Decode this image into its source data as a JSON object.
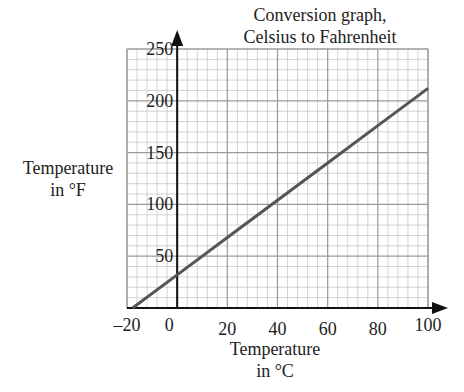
{
  "chart_data": {
    "type": "line",
    "title": "Conversion graph, Celsius to Fahrenheit",
    "title_lines": [
      "Conversion graph,",
      "Celsius to Fahrenheit"
    ],
    "xlabel": "Temperature in °C",
    "xlabel_lines": [
      "Temperature",
      "in °C"
    ],
    "ylabel": "Temperature in °F",
    "ylabel_lines": [
      "Temperature",
      "in °F"
    ],
    "xlim": [
      -20,
      100
    ],
    "ylim": [
      0,
      250
    ],
    "x_ticks": [
      -20,
      0,
      20,
      40,
      60,
      80,
      100
    ],
    "x_tick_labels": [
      "–20",
      "0",
      "20",
      "40",
      "60",
      "80",
      "100"
    ],
    "y_ticks": [
      50,
      100,
      150,
      200,
      250
    ],
    "y_tick_labels": [
      "50",
      "100",
      "150",
      "200",
      "250"
    ],
    "grid": true,
    "grid_minor_x_step": 4,
    "grid_minor_y_step": 10,
    "grid_major_x_step": 20,
    "grid_major_y_step": 50,
    "series": [
      {
        "name": "°F = 1.8 × °C + 32",
        "x": [
          -17.8,
          0,
          20,
          40,
          60,
          80,
          100
        ],
        "y": [
          0,
          32,
          68,
          104,
          140,
          176,
          212
        ],
        "color": "#555555"
      }
    ],
    "legend": null
  },
  "colors": {
    "grid_minor": "#c8c8c8",
    "grid_major": "#9a9a9a",
    "axis": "#111111",
    "line": "#555555"
  }
}
